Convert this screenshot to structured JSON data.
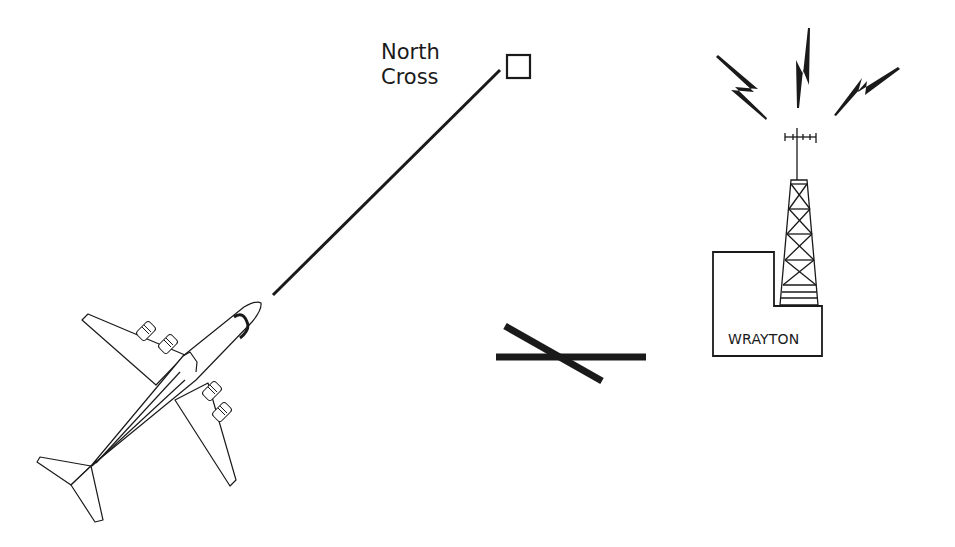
{
  "diagram": {
    "colors": {
      "ink": "#1a1a1a",
      "background": "#ffffff"
    },
    "labels": {
      "north_cross_line1": "North",
      "north_cross_line2": "Cross",
      "wrayton": "WRAYTON"
    },
    "elements": [
      {
        "name": "aircraft",
        "description": "four-engine jet airliner viewed from above, heading north-east"
      },
      {
        "name": "track-line",
        "description": "straight line from aircraft nose to North Cross reporting point"
      },
      {
        "name": "north-cross-waypoint",
        "description": "square waypoint symbol",
        "label": "North Cross"
      },
      {
        "name": "runway-symbol",
        "description": "two crossing thick bars"
      },
      {
        "name": "radio-mast",
        "description": "lattice transmission tower with antenna and three lightning bolts"
      },
      {
        "name": "wrayton-building",
        "description": "L-shaped building outline",
        "label": "WRAYTON"
      }
    ]
  }
}
